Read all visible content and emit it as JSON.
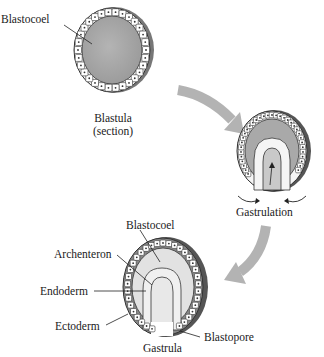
{
  "diagram": {
    "stages": [
      {
        "id": "blastula",
        "caption_line1": "Blastula",
        "caption_line2": "(section)",
        "labels": [
          "Blastocoel"
        ]
      },
      {
        "id": "gastrulation",
        "caption": "Gastrulation"
      },
      {
        "id": "gastrula",
        "caption": "Gastrula",
        "labels": [
          "Blastocoel",
          "Archenteron",
          "Endoderm",
          "Ectoderm",
          "Blastopore"
        ]
      }
    ],
    "labels": {
      "blastula_blastocoel": "Blastocoel",
      "blastula_caption_1": "Blastula",
      "blastula_caption_2": "(section)",
      "gastrulation_caption": "Gastrulation",
      "gastrula_blastocoel": "Blastocoel",
      "archenteron": "Archenteron",
      "endoderm": "Endoderm",
      "ectoderm": "Ectoderm",
      "blastopore": "Blastopore",
      "gastrula_caption": "Gastrula"
    },
    "colors": {
      "background": "#ffffff",
      "blastocoel_fill": "#a9a9a9",
      "gastrula_cavity": "#e2e2e2",
      "cell_fill": "#ffffff",
      "cell_stroke": "#333333",
      "arrow": "#b3b3b3",
      "text": "#1a1a1a"
    }
  }
}
